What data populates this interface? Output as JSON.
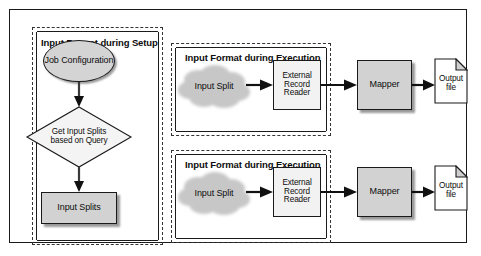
{
  "figure": {
    "background_color": "#ffffff",
    "frame_color": "#1a1a1a"
  },
  "colors": {
    "gray_fill": "#d2d2d2",
    "ellipse_fill": "#d4d4d4",
    "white_fill": "#f2f2f2",
    "cloud_fill": "#c9c9c9",
    "stroke": "#1a1a1a",
    "text": "#0d0d0d"
  },
  "panels": {
    "setup": {
      "title": "Input Format during Setup",
      "nodes": {
        "job_configuration": "Job Configuration",
        "get_input_splits": "Get Input Splits based on Query",
        "input_splits": "Input Splits"
      }
    },
    "execution_1": {
      "title": "Input Format during Execution",
      "nodes": {
        "input_split": "Input Split",
        "external_record_reader": "External Record Reader"
      }
    },
    "execution_2": {
      "title": "Input Format during Execution",
      "nodes": {
        "input_split": "Input Split",
        "external_record_reader": "External Record Reader"
      }
    }
  },
  "rows": [
    {
      "mapper": "Mapper",
      "output_file": "Output file"
    },
    {
      "mapper": "Mapper",
      "output_file": "Output file"
    }
  ],
  "icons": {
    "cloud": "cloud-icon",
    "document": "document-page-icon",
    "arrow": "arrow-right-icon",
    "arrow_down": "arrow-down-icon"
  }
}
